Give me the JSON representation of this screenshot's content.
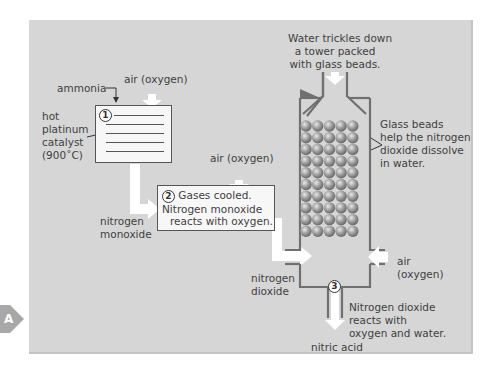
{
  "diagram": {
    "type": "process-flow",
    "colors": {
      "panel_background": "#d6d6d6",
      "box_fill": "#f7f7f7",
      "arrow_fill": "#ffffff",
      "tower_wall": "#707070",
      "bead_fill": "#9a9a9a",
      "marker_tab": "#a8a8a8"
    },
    "marker": {
      "label": "A"
    },
    "step1": {
      "number": "1",
      "inputs": {
        "ammonia": "ammonia",
        "air": "air (oxygen)"
      },
      "catalyst_label": [
        "hot",
        "platinum",
        "catalyst",
        "(900˚C)"
      ],
      "output_label": [
        "nitrogen",
        "monoxide"
      ]
    },
    "step2": {
      "number": "2",
      "air_label": "air (oxygen)",
      "text": [
        "Gases cooled.",
        "Nitrogen monoxide",
        "reacts with oxygen."
      ],
      "output_label": [
        "nitrogen",
        "dioxide"
      ]
    },
    "tower": {
      "top_label": [
        "Water trickles down",
        "a tower packed",
        "with glass beads."
      ],
      "beads_label": [
        "Glass beads",
        "help the nitrogen",
        "dioxide dissolve",
        "in water."
      ],
      "air_label": [
        "air",
        "(oxygen)"
      ],
      "bead_columns": 5,
      "bead_rows": 10
    },
    "step3": {
      "number": "3",
      "text": [
        "Nitrogen dioxide",
        "reacts with",
        "oxygen and water."
      ],
      "product_label": "nitric acid"
    }
  }
}
